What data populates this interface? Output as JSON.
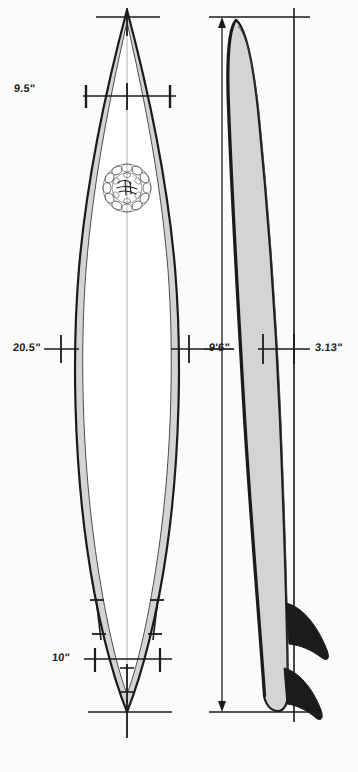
{
  "drawing": {
    "title": "Surfboard Shaping Blueprint",
    "subject": "surfboard",
    "views": [
      {
        "name": "outline-view",
        "label": "Outline (plan) view"
      },
      {
        "name": "profile-view",
        "label": "Rocker (side) profile view"
      }
    ],
    "background_color": "#fbfbfa",
    "outline_stroke_color": "#1b1b1b",
    "rail_band_color": "#d4d4d4",
    "deck_fill_color": "#ffffff",
    "fin_color": "#1b1b1b",
    "stringer_color": "#cfcfcf",
    "dimension_line_color": "#1b1b1b"
  },
  "dimensions": [
    {
      "id": "nose-width",
      "label": "9.5\"",
      "name": "nose-width-dimension",
      "view": "outline-view",
      "x": 52,
      "y": 89,
      "measures": "nose width"
    },
    {
      "id": "max-width",
      "label": "20.5\"",
      "name": "max-width-dimension",
      "view": "outline-view",
      "x": 17,
      "y": 342,
      "measures": "wide point width"
    },
    {
      "id": "tail-width",
      "label": "10\"",
      "name": "tail-width-dimension",
      "view": "outline-view",
      "x": 56,
      "y": 652,
      "measures": "tail width"
    },
    {
      "id": "length",
      "label": "9'6\"",
      "name": "length-dimension",
      "view": "profile-view",
      "x": 210,
      "y": 342,
      "measures": "overall length"
    },
    {
      "id": "thickness",
      "label": "3.13\"",
      "name": "thickness-dimension",
      "view": "profile-view",
      "x": 314,
      "y": 342,
      "measures": "maximum thickness"
    }
  ],
  "logo": {
    "name": "floral-wreath-logo",
    "description": "circular floral wreath emblem with script lettering",
    "cx": 127,
    "cy": 188,
    "r": 26
  },
  "fins": [
    {
      "name": "rear-fin",
      "view": "profile-view"
    },
    {
      "name": "front-fin",
      "view": "profile-view"
    }
  ],
  "fin_marks": [
    {
      "name": "fin-mark-left",
      "view": "outline-view"
    },
    {
      "name": "fin-mark-right",
      "view": "outline-view"
    }
  ]
}
